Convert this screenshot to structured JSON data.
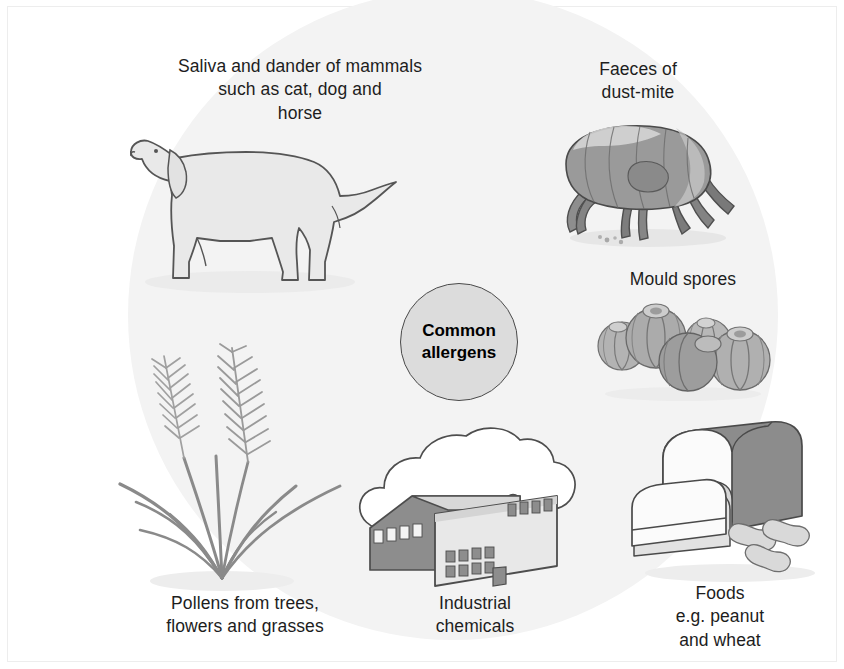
{
  "figure": {
    "background_color": "#ffffff",
    "circle_color": "#f3f3f3",
    "frame_color": "#ededed",
    "ink_color": "#555555",
    "dark_fill": "#8c8c8c",
    "light_fill": "#e8e8e8"
  },
  "center": {
    "label": "Common\nallergens",
    "fill": "#dcdcdc",
    "stroke": "#4a4a4a"
  },
  "nodes": [
    {
      "key": "mammals",
      "label": "Saliva and dander of mammals\nsuch as cat, dog and\nhorse",
      "icon": "dog-illustration"
    },
    {
      "key": "dustmite",
      "label": "Faeces of\ndust-mite",
      "icon": "dust-mite-illustration"
    },
    {
      "key": "mould",
      "label": "Mould spores",
      "icon": "mould-spores-illustration"
    },
    {
      "key": "foods",
      "label": "Foods\ne.g. peanut\nand wheat",
      "icon": "bread-and-peanuts-illustration"
    },
    {
      "key": "chemicals",
      "label": "Industrial\nchemicals",
      "icon": "factory-illustration"
    },
    {
      "key": "pollens",
      "label": "Pollens from trees,\nflowers and grasses",
      "icon": "grass-illustration"
    }
  ]
}
